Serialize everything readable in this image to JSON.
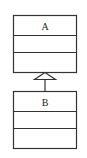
{
  "diagram": {
    "type": "uml-class-inheritance",
    "classes": [
      {
        "name": "A",
        "role": "superclass",
        "compartments": [
          "A",
          "",
          ""
        ]
      },
      {
        "name": "B",
        "role": "subclass",
        "compartments": [
          "B",
          "",
          ""
        ]
      }
    ],
    "relationship": {
      "from": "B",
      "to": "A",
      "kind": "generalization",
      "arrow": "hollow-triangle"
    },
    "colors": {
      "stroke": "#333333",
      "fill": "#ffffff"
    }
  }
}
